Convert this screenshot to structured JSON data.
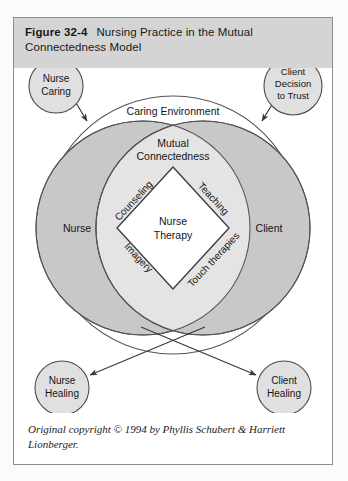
{
  "figure": {
    "number_label": "Figure 32-4",
    "title": "Nursing Practice in the Mutual Connectedness Model",
    "caption": "Original copyright © 1994 by Phyllis Schubert & Harriett Lionberger."
  },
  "colors": {
    "title_bar_background": "#d4d4d4",
    "figure_border": "#8d8d8d",
    "outer_ring_fill": "#ffffff",
    "nurse_client_fill": "#c8c8c8",
    "mutual_connectedness_fill": "#e4e4e4",
    "nurse_therapy_fill": "#ffffff",
    "callout_fill": "#e0e0e0",
    "stroke": "#4a4a4a",
    "text": "#141416"
  },
  "diagram": {
    "type": "venn-concentric",
    "outer_label": "Caring Environment",
    "overlap_label_line1": "Mutual",
    "overlap_label_line2": "Connectedness",
    "left_circle_label": "Nurse",
    "right_circle_label": "Client",
    "center_label_line1": "Nurse",
    "center_label_line2": "Therapy",
    "diamond_edges": [
      {
        "name": "counseling",
        "label": "Counseling",
        "position": "upper-left"
      },
      {
        "name": "teaching",
        "label": "Teaching",
        "position": "upper-right"
      },
      {
        "name": "imagery",
        "label": "Imagery",
        "position": "lower-left"
      },
      {
        "name": "touch-therapies",
        "label": "Touch therapies",
        "position": "lower-right"
      }
    ],
    "callouts": [
      {
        "name": "nurse-caring",
        "lines": [
          "Nurse",
          "Caring"
        ],
        "position": "top-left",
        "arrow": "inward"
      },
      {
        "name": "client-decision-to-trust",
        "lines": [
          "Client",
          "Decision",
          "to Trust"
        ],
        "position": "top-right",
        "arrow": "inward"
      },
      {
        "name": "nurse-healing",
        "lines": [
          "Nurse",
          "Healing"
        ],
        "position": "bottom-left",
        "arrow": "outward"
      },
      {
        "name": "client-healing",
        "lines": [
          "Client",
          "Healing"
        ],
        "position": "bottom-right",
        "arrow": "outward"
      }
    ]
  }
}
